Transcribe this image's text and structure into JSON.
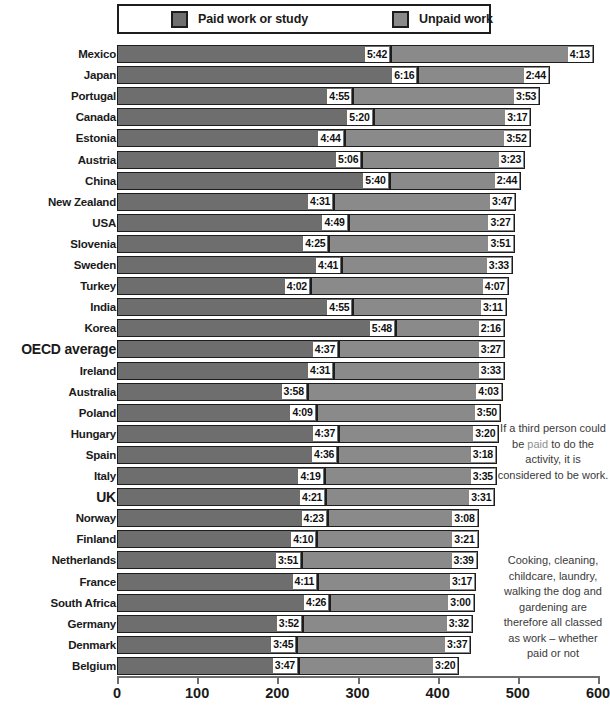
{
  "legend": {
    "entries": [
      {
        "label": "Paid work or study",
        "color": "#6e6e6e",
        "key": "paid"
      },
      {
        "label": "Unpaid work",
        "color": "#8a8a8a",
        "key": "unpaid"
      }
    ]
  },
  "notes": [
    {
      "id": "note-1",
      "text_before": "If a third person could be ",
      "highlight": "paid",
      "text_after": " to do the activity, it is considered to be work."
    },
    {
      "id": "note-2",
      "text_before": "Cooking, cleaning, childcare, laundry, walking the dog and gardening are therefore all classed as work – whether paid or not",
      "highlight": "",
      "text_after": ""
    }
  ],
  "axis": {
    "ticks": [
      "0",
      "100",
      "200",
      "300",
      "400",
      "500",
      "600"
    ],
    "min": 0,
    "max": 600,
    "unit": "minutes"
  },
  "chart_data": {
    "type": "bar",
    "orientation": "horizontal",
    "stacked": true,
    "title": "",
    "xlabel": "",
    "ylabel": "",
    "xlim": [
      0,
      600
    ],
    "grid": false,
    "legend_position": "top",
    "categories": [
      "Mexico",
      "Japan",
      "Portugal",
      "Canada",
      "Estonia",
      "Austria",
      "China",
      "New Zealand",
      "USA",
      "Slovenia",
      "Sweden",
      "Turkey",
      "India",
      "Korea",
      "OECD average",
      "Ireland",
      "Australia",
      "Poland",
      "Hungary",
      "Spain",
      "Italy",
      "UK",
      "Norway",
      "Finland",
      "Netherlands",
      "France",
      "South Africa",
      "Germany",
      "Denmark",
      "Belgium"
    ],
    "highlight_categories": [
      "OECD average",
      "UK"
    ],
    "series": [
      {
        "name": "Paid work or study",
        "color": "#6e6e6e",
        "labels": [
          "5:42",
          "6:16",
          "4:55",
          "5:20",
          "4:44",
          "5:06",
          "5:40",
          "4:31",
          "4:49",
          "4:25",
          "4:41",
          "4:02",
          "4:55",
          "5:48",
          "4:37",
          "4:31",
          "3:58",
          "4:09",
          "4:37",
          "4:36",
          "4:19",
          "4:21",
          "4:23",
          "4:10",
          "3:51",
          "4:11",
          "4:26",
          "3:52",
          "3:45",
          "3:47"
        ],
        "values": [
          342,
          376,
          295,
          320,
          284,
          306,
          340,
          271,
          289,
          265,
          281,
          242,
          295,
          348,
          277,
          271,
          238,
          249,
          277,
          276,
          259,
          261,
          263,
          250,
          231,
          251,
          266,
          232,
          225,
          227
        ]
      },
      {
        "name": "Unpaid work",
        "color": "#8a8a8a",
        "labels": [
          "4:13",
          "2:44",
          "3:53",
          "3:17",
          "3:52",
          "3:23",
          "2:44",
          "3:47",
          "3:27",
          "3:51",
          "3:33",
          "4:07",
          "3:11",
          "2:16",
          "3:27",
          "3:33",
          "4:03",
          "3:50",
          "3:20",
          "3:18",
          "3:35",
          "3:31",
          "3:08",
          "3:21",
          "3:39",
          "3:17",
          "3:00",
          "3:32",
          "3:37",
          "3:20"
        ],
        "values": [
          253,
          164,
          233,
          197,
          232,
          203,
          164,
          227,
          207,
          231,
          213,
          247,
          191,
          136,
          207,
          213,
          243,
          230,
          200,
          198,
          215,
          211,
          188,
          201,
          219,
          197,
          180,
          212,
          217,
          200
        ]
      }
    ],
    "totals": [
      595,
      540,
      528,
      517,
      516,
      509,
      504,
      498,
      496,
      496,
      494,
      489,
      486,
      484,
      484,
      484,
      481,
      479,
      477,
      474,
      474,
      472,
      451,
      451,
      450,
      448,
      446,
      444,
      442,
      427
    ]
  }
}
